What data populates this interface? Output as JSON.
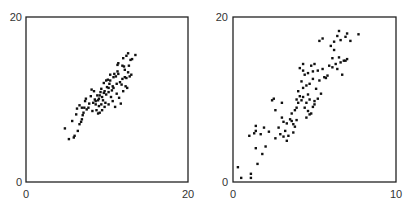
{
  "chart_data": [
    {
      "type": "scatter",
      "title": "",
      "xlabel": "",
      "ylabel": "",
      "xlim": [
        0,
        20
      ],
      "ylim": [
        0,
        20
      ],
      "grid": false,
      "x_ticks": [
        "0",
        "20"
      ],
      "y_ticks": [
        "0",
        "20"
      ],
      "points": [
        [
          4.8,
          6.5
        ],
        [
          5.3,
          5.2
        ],
        [
          5.9,
          5.4
        ],
        [
          6.0,
          5.6
        ],
        [
          6.2,
          8.2
        ],
        [
          5.7,
          7.4
        ],
        [
          6.4,
          6.2
        ],
        [
          6.6,
          7.0
        ],
        [
          6.9,
          7.6
        ],
        [
          7.0,
          8.1
        ],
        [
          6.3,
          8.9
        ],
        [
          6.6,
          9.3
        ],
        [
          6.9,
          9.0
        ],
        [
          7.2,
          9.0
        ],
        [
          7.3,
          9.8
        ],
        [
          7.1,
          8.4
        ],
        [
          8.0,
          10.4
        ],
        [
          8.1,
          11.2
        ],
        [
          8.4,
          11.0
        ],
        [
          8.8,
          10.5
        ],
        [
          8.6,
          9.8
        ],
        [
          8.7,
          8.7
        ],
        [
          8.9,
          8.3
        ],
        [
          9.1,
          8.4
        ],
        [
          9.0,
          9.2
        ],
        [
          9.3,
          9.4
        ],
        [
          9.4,
          8.7
        ],
        [
          9.7,
          9.1
        ],
        [
          9.5,
          9.9
        ],
        [
          9.8,
          9.6
        ],
        [
          9.4,
          10.3
        ],
        [
          9.9,
          10.6
        ],
        [
          10.2,
          10.9
        ],
        [
          10.0,
          11.5
        ],
        [
          10.3,
          11.9
        ],
        [
          10.6,
          11.1
        ],
        [
          10.1,
          12.4
        ],
        [
          10.8,
          12.7
        ],
        [
          10.4,
          13.0
        ],
        [
          10.9,
          13.1
        ],
        [
          11.1,
          12.8
        ],
        [
          11.3,
          13.4
        ],
        [
          11.6,
          12.1
        ],
        [
          11.9,
          12.5
        ],
        [
          12.2,
          13.6
        ],
        [
          12.3,
          11.6
        ],
        [
          12.0,
          11.0
        ],
        [
          11.5,
          10.2
        ],
        [
          11.2,
          10.7
        ],
        [
          10.7,
          9.8
        ],
        [
          10.5,
          10.3
        ],
        [
          10.2,
          9.4
        ],
        [
          11.0,
          9.1
        ],
        [
          11.7,
          9.5
        ],
        [
          12.4,
          12.6
        ],
        [
          12.6,
          13.3
        ],
        [
          12.8,
          12.8
        ],
        [
          13.0,
          13.0
        ],
        [
          12.1,
          14.0
        ],
        [
          11.4,
          14.4
        ],
        [
          11.3,
          14.2
        ],
        [
          12.0,
          15.0
        ],
        [
          12.4,
          15.3
        ],
        [
          12.9,
          14.8
        ],
        [
          13.1,
          14.9
        ],
        [
          12.6,
          15.6
        ],
        [
          13.5,
          15.4
        ],
        [
          12.7,
          14.1
        ],
        [
          9.6,
          12.0
        ],
        [
          9.2,
          10.9
        ],
        [
          8.3,
          9.6
        ],
        [
          8.5,
          10.0
        ],
        [
          7.8,
          9.5
        ],
        [
          7.5,
          8.8
        ],
        [
          8.2,
          8.6
        ],
        [
          9.0,
          10.1
        ],
        [
          9.3,
          11.3
        ],
        [
          9.9,
          12.3
        ],
        [
          10.7,
          11.6
        ],
        [
          11.8,
          11.8
        ],
        [
          12.5,
          11.4
        ],
        [
          10.4,
          12.3
        ],
        [
          9.6,
          10.8
        ],
        [
          8.9,
          9.9
        ],
        [
          7.7,
          9.0
        ],
        [
          6.8,
          7.3
        ],
        [
          10.2,
          11.4
        ],
        [
          11.2,
          11.9
        ],
        [
          11.9,
          14.1
        ],
        [
          9.1,
          10.5
        ],
        [
          10.8,
          11.4
        ],
        [
          12.2,
          12.7
        ],
        [
          8.6,
          9.4
        ],
        [
          7.4,
          10.1
        ],
        [
          9.7,
          11.0
        ],
        [
          11.4,
          13.1
        ]
      ]
    },
    {
      "type": "scatter",
      "title": "",
      "xlabel": "",
      "ylabel": "",
      "xlim": [
        0,
        10
      ],
      "ylim": [
        0,
        20
      ],
      "grid": false,
      "x_ticks": [
        "0",
        "10"
      ],
      "y_ticks": [
        "0",
        "20"
      ],
      "points": [
        [
          0.3,
          1.8
        ],
        [
          0.5,
          0.5
        ],
        [
          1.1,
          0.5
        ],
        [
          1.1,
          1.0
        ],
        [
          1.5,
          2.2
        ],
        [
          1.8,
          3.4
        ],
        [
          1.4,
          4.1
        ],
        [
          2.0,
          4.3
        ],
        [
          1.0,
          5.6
        ],
        [
          1.3,
          5.9
        ],
        [
          1.4,
          6.2
        ],
        [
          1.7,
          5.8
        ],
        [
          1.4,
          6.8
        ],
        [
          1.9,
          6.6
        ],
        [
          2.4,
          9.9
        ],
        [
          2.5,
          10.1
        ],
        [
          2.6,
          8.7
        ],
        [
          2.8,
          6.6
        ],
        [
          3.0,
          9.6
        ],
        [
          3.0,
          7.8
        ],
        [
          3.1,
          7.3
        ],
        [
          3.3,
          7.1
        ],
        [
          3.2,
          6.2
        ],
        [
          2.9,
          5.8
        ],
        [
          3.1,
          5.5
        ],
        [
          3.4,
          5.6
        ],
        [
          3.5,
          7.6
        ],
        [
          3.6,
          7.4
        ],
        [
          3.7,
          7.0
        ],
        [
          3.8,
          6.7
        ],
        [
          3.7,
          6.0
        ],
        [
          3.6,
          8.3
        ],
        [
          3.8,
          8.7
        ],
        [
          3.9,
          9.0
        ],
        [
          4.0,
          9.6
        ],
        [
          4.2,
          9.9
        ],
        [
          3.9,
          10.0
        ],
        [
          4.1,
          10.4
        ],
        [
          4.3,
          10.3
        ],
        [
          4.4,
          9.0
        ],
        [
          4.5,
          7.8
        ],
        [
          4.7,
          8.2
        ],
        [
          4.6,
          8.6
        ],
        [
          4.8,
          8.3
        ],
        [
          4.9,
          9.1
        ],
        [
          5.0,
          9.4
        ],
        [
          4.5,
          9.6
        ],
        [
          4.7,
          10.0
        ],
        [
          5.2,
          10.1
        ],
        [
          5.4,
          10.7
        ],
        [
          4.3,
          11.4
        ],
        [
          4.5,
          11.7
        ],
        [
          4.2,
          12.2
        ],
        [
          4.7,
          11.9
        ],
        [
          4.9,
          12.5
        ],
        [
          5.3,
          12.3
        ],
        [
          5.6,
          12.7
        ],
        [
          5.7,
          12.6
        ],
        [
          5.2,
          13.5
        ],
        [
          4.3,
          13.5
        ],
        [
          4.4,
          13.0
        ],
        [
          4.6,
          13.2
        ],
        [
          4.9,
          13.4
        ],
        [
          4.1,
          13.8
        ],
        [
          4.3,
          14.3
        ],
        [
          4.8,
          14.1
        ],
        [
          5.0,
          14.3
        ],
        [
          5.5,
          13.7
        ],
        [
          5.9,
          14.1
        ],
        [
          6.1,
          13.9
        ],
        [
          6.3,
          14.3
        ],
        [
          6.4,
          13.7
        ],
        [
          6.6,
          14.5
        ],
        [
          6.8,
          14.7
        ],
        [
          6.5,
          15.1
        ],
        [
          6.9,
          14.7
        ],
        [
          7.0,
          14.9
        ],
        [
          6.1,
          15.0
        ],
        [
          6.2,
          16.0
        ],
        [
          6.0,
          16.5
        ],
        [
          5.5,
          17.4
        ],
        [
          5.3,
          17.1
        ],
        [
          6.4,
          17.7
        ],
        [
          6.6,
          17.2
        ],
        [
          6.9,
          17.6
        ],
        [
          7.0,
          18.0
        ],
        [
          6.5,
          18.3
        ],
        [
          7.7,
          17.9
        ],
        [
          7.2,
          17.1
        ],
        [
          6.2,
          17.0
        ],
        [
          2.2,
          6.1
        ],
        [
          2.6,
          5.3
        ],
        [
          3.3,
          5.0
        ],
        [
          3.9,
          7.5
        ],
        [
          4.6,
          10.6
        ],
        [
          5.1,
          11.3
        ],
        [
          5.8,
          12.9
        ],
        [
          6.7,
          13.0
        ],
        [
          5.0,
          9.8
        ],
        [
          4.0,
          11.0
        ]
      ]
    }
  ]
}
